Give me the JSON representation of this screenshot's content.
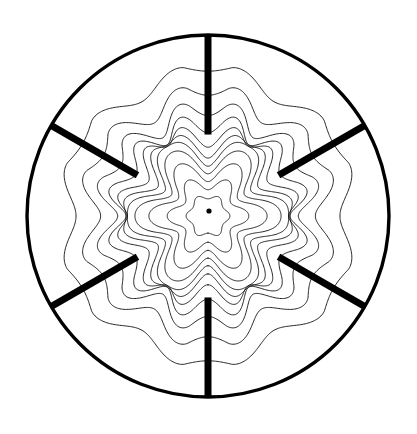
{
  "figure": {
    "kind": "contour-plot",
    "title": "",
    "background_color": "#ffffff",
    "line_color": "#000000",
    "canvas": {
      "width": 417,
      "height": 434
    }
  },
  "chart_data": {
    "type": "line",
    "subtype": "polar-contour-map",
    "title": "",
    "subtitle": "",
    "xlabel": "",
    "ylabel": "",
    "grid": false,
    "legend": null,
    "annotations": [],
    "axis_ranges": {
      "x": [
        -1,
        1
      ],
      "y": [
        -1,
        1
      ]
    },
    "geometry": {
      "center": {
        "x": 208,
        "y": 216
      },
      "outer_radius": 181,
      "outer_boundary_stroke_width": 3.4,
      "outer_boundary_stroke": "#000000",
      "center_marker": {
        "x": 209,
        "y": 211,
        "radius": 2.6,
        "color": "#000000",
        "label": ""
      },
      "slot_count": 6,
      "slot_angles_deg": [
        90,
        150,
        210,
        270,
        330,
        30
      ],
      "slot_inner_radius_frac": 0.45,
      "slot_outer_radius_frac": 1.0,
      "slot_width_px": 7.0,
      "slot_color": "#000000"
    },
    "contours": {
      "count": 11,
      "stroke_width": 0.85,
      "stroke": "#000000",
      "levels": [
        0.1,
        0.18,
        0.26,
        0.34,
        0.42,
        0.5,
        0.58,
        0.66,
        0.74,
        0.82,
        0.9
      ],
      "base_radius_frac": [
        0.105,
        0.175,
        0.245,
        0.315,
        0.385,
        0.455,
        0.53,
        0.61,
        0.69,
        0.775,
        0.87
      ],
      "lobe_amplitude_frac": [
        0.01,
        0.03,
        0.055,
        0.082,
        0.11,
        0.135,
        0.15,
        0.15,
        0.135,
        0.108,
        0.07
      ],
      "lobe_harmonic": 6,
      "lobe_phase_deg": 0,
      "pinch_strength": [
        0.02,
        0.1,
        0.24,
        0.42,
        0.62,
        0.8,
        0.9,
        0.9,
        0.8,
        0.62,
        0.4
      ],
      "pinch_half_width_deg": 21,
      "samples_per_curve": 720
    }
  }
}
